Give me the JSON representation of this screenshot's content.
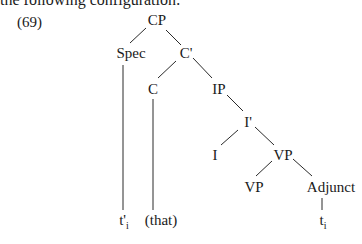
{
  "intro_text": "the following configuration:",
  "example_number": "(69)",
  "tree": {
    "nodes": {
      "cp": "CP",
      "spec": "Spec",
      "cbar": "C'",
      "c": "C",
      "ip": "IP",
      "ibar": "I'",
      "i": "I",
      "vp_upper": "VP",
      "vp_lower": "VP",
      "adjunct": "Adjunct"
    },
    "leaves": {
      "trace_prime": {
        "base": "t'",
        "sub": "i"
      },
      "that": "(that)",
      "trace": {
        "base": "t",
        "sub": "i"
      }
    }
  }
}
